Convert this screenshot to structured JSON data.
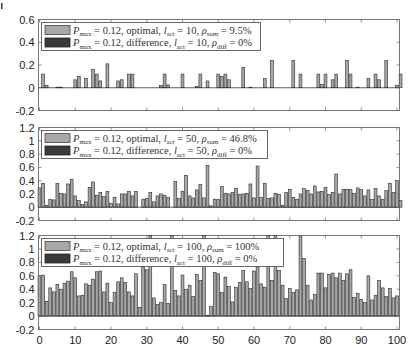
{
  "chart_data": [
    {
      "type": "bar",
      "title": "",
      "xlabel": "",
      "ylabel": "",
      "xlim": [
        0,
        100
      ],
      "ylim": [
        -0.2,
        0.6
      ],
      "yticks": [
        -0.2,
        0,
        0.2,
        0.4,
        0.6
      ],
      "xticks": [
        0,
        10,
        20,
        30,
        40,
        50,
        60,
        70,
        80,
        90,
        100
      ],
      "grid": false,
      "legend_position": "upper left",
      "series": [
        {
          "name": "P_max = 0.12, optimal, l_act = 10, ρ_sum = 9.5%",
          "color": "#a8a8a8",
          "values": [
            0,
            0.12,
            0.02,
            0,
            0,
            0.005,
            0.005,
            0,
            0,
            0,
            0.07,
            0.1,
            0,
            0.08,
            0,
            0.16,
            0.12,
            0.06,
            0,
            0.21,
            0,
            0,
            0.06,
            0.07,
            0,
            0.12,
            0.12,
            0,
            0,
            0,
            0,
            0,
            0,
            0,
            0.02,
            0.12,
            0.025,
            0,
            0,
            0,
            0.12,
            0,
            0,
            0,
            0.01,
            0.12,
            0,
            0.06,
            0,
            0,
            0.12,
            0.1,
            0.12,
            0.07,
            0,
            0,
            0,
            0.18,
            0,
            0.005,
            0,
            0,
            0,
            0.08,
            0,
            0.24,
            0,
            0,
            0,
            0,
            0,
            0.24,
            0,
            0.12,
            0,
            0,
            0,
            0,
            0.12,
            0.03,
            0.12,
            0,
            0.07,
            0.12,
            0,
            0,
            0.24,
            0.12,
            0,
            0.005,
            0,
            0,
            0.08,
            0,
            0.12,
            0.07,
            0,
            0.24,
            0,
            0,
            0.02,
            0.12,
            0
          ]
        },
        {
          "name": "P_max = 0.12, difference, l_act = 10, ρ_diff = 0%",
          "color": "#3a3a3a",
          "values": "all 0"
        }
      ]
    },
    {
      "type": "bar",
      "xlim": [
        0,
        100
      ],
      "ylim": [
        -0.2,
        1.2
      ],
      "yticks": [
        -0.2,
        0,
        0.2,
        0.4,
        0.6,
        0.8,
        1,
        1.2
      ],
      "xticks": [
        0,
        10,
        20,
        30,
        40,
        50,
        60,
        70,
        80,
        90,
        100
      ],
      "grid": false,
      "legend_position": "upper left",
      "series": [
        {
          "name": "P_max = 0.12, optimal, l_act = 50, ρ_sum = 46.8%",
          "color": "#a8a8a8",
          "values": [
            0.29,
            0.36,
            0.03,
            0.12,
            0.11,
            0.36,
            0.21,
            0.2,
            0.35,
            0.42,
            0.17,
            0.1,
            0.04,
            0.08,
            0.3,
            0.38,
            0.18,
            0.22,
            0.16,
            0.24,
            0.06,
            0.15,
            0.05,
            0.2,
            0.2,
            0.24,
            0.17,
            0.24,
            0,
            0.12,
            0.13,
            0.22,
            0.08,
            0.17,
            0.2,
            0.18,
            0.15,
            0,
            0.39,
            0.13,
            0.24,
            0.48,
            0.17,
            0.14,
            0.26,
            0.34,
            0.14,
            0.63,
            0.02,
            0.12,
            0.12,
            0.31,
            0.21,
            0.2,
            0.22,
            0.28,
            0.19,
            0.2,
            0.21,
            0.35,
            0.14,
            0.62,
            0.15,
            0.36,
            0.13,
            0.14,
            0.21,
            0.19,
            0.03,
            0.22,
            0.27,
            0.15,
            0.12,
            0.2,
            0.28,
            0.25,
            0.2,
            0.32,
            0.23,
            0.24,
            0.3,
            0.19,
            0.22,
            0.5,
            0.2,
            0.27,
            0.27,
            0.27,
            0.21,
            0.29,
            0.27,
            0.17,
            0.26,
            0.12,
            0.28,
            0.17,
            0.12,
            0.25,
            0.36,
            0.22,
            0.4,
            0.1
          ]
        },
        {
          "name": "P_max = 0.12, difference, l_act = 50, ρ_diff = 0%",
          "color": "#3a3a3a",
          "values": "all 0"
        }
      ]
    },
    {
      "type": "bar",
      "xlim": [
        0,
        100
      ],
      "ylim": [
        -0.2,
        1.2
      ],
      "yticks": [
        -0.2,
        0,
        0.2,
        0.4,
        0.6,
        0.8,
        1,
        1.2
      ],
      "xticks": [
        0,
        10,
        20,
        30,
        40,
        50,
        60,
        70,
        80,
        90,
        100
      ],
      "grid": false,
      "legend_position": "upper left",
      "series": [
        {
          "name": "P_max = 0.12, optimal, l_act = 100, ρ_sum = 100%",
          "color": "#a8a8a8",
          "values": [
            0.6,
            0.61,
            0.22,
            0.42,
            0.36,
            0.47,
            0.4,
            0.49,
            0.52,
            0.66,
            0.57,
            0.3,
            0.31,
            0.48,
            0.46,
            0.55,
            0.66,
            0.67,
            0.36,
            0.49,
            0.2,
            0.35,
            0.51,
            0.57,
            0.5,
            0.36,
            0.3,
            0.63,
            0.13,
            0.73,
            0.69,
            1.2,
            0.27,
            0.17,
            0.2,
            0.47,
            0.19,
            1.2,
            0.38,
            0.3,
            0.61,
            0.4,
            0.46,
            0.29,
            0.62,
            0.53,
            1.2,
            0.01,
            0.14,
            0.65,
            0.63,
            0.35,
            0.58,
            0.44,
            0.21,
            0.43,
            0.5,
            0.68,
            0.51,
            0.41,
            0.67,
            0.73,
            0.48,
            0.43,
            1.2,
            0.53,
            1.2,
            0.68,
            0.46,
            0.26,
            0.41,
            0.35,
            0.39,
            1.19,
            0.86,
            0.46,
            0.24,
            0.32,
            0.64,
            0.64,
            0.42,
            0.62,
            0.64,
            0.57,
            0.64,
            0.53,
            0.63,
            0.69,
            0.28,
            0.34,
            0.25,
            0.2,
            0.6,
            0.24,
            0.31,
            0.53,
            0.42,
            0.29,
            0.41,
            0.27,
            0.3
          ]
        },
        {
          "name": "P_max = 0.12, difference, l_act = 100, ρ_diff = 0%",
          "color": "#3a3a3a",
          "values": "all 0"
        }
      ]
    }
  ],
  "panels": [
    {
      "yticks": [
        "0.6",
        "0.4",
        "0.2",
        "0",
        "-0.2"
      ],
      "legend": {
        "line1": {
          "P": "P",
          "sub1": "max",
          "eq1": " = 0.12, optimal, ",
          "l": "l",
          "sub2": "act",
          "eq2": " = 10, ",
          "rho": "ρ",
          "sub3": "sum",
          "eq3": " = 9.5%"
        },
        "line2": {
          "P": "P",
          "sub1": "max",
          "eq1": " = 0.12, difference, ",
          "l": "l",
          "sub2": "act",
          "eq2": " = 10, ",
          "rho": "ρ",
          "sub3": "diff",
          "eq3": " = 0%"
        }
      }
    },
    {
      "yticks": [
        "1.2",
        "1",
        "0.8",
        "0.6",
        "0.4",
        "0.2",
        "0",
        "-0.2"
      ],
      "legend": {
        "line1": {
          "P": "P",
          "sub1": "max",
          "eq1": " = 0.12, optimal, ",
          "l": "l",
          "sub2": "act",
          "eq2": " = 50, ",
          "rho": "ρ",
          "sub3": "sum",
          "eq3": " = 46.8%"
        },
        "line2": {
          "P": "P",
          "sub1": "max",
          "eq1": " = 0.12, difference, ",
          "l": "l",
          "sub2": "act",
          "eq2": " = 50, ",
          "rho": "ρ",
          "sub3": "diff",
          "eq3": " = 0%"
        }
      }
    },
    {
      "yticks": [
        "1.2",
        "1",
        "0.8",
        "0.6",
        "0.4",
        "0.2",
        "0",
        "-0.2"
      ],
      "legend": {
        "line1": {
          "P": "P",
          "sub1": "max",
          "eq1": " = 0.12, optimal, ",
          "l": "l",
          "sub2": "act",
          "eq2": " = 100, ",
          "rho": "ρ",
          "sub3": "sum",
          "eq3": " = 100%"
        },
        "line2": {
          "P": "P",
          "sub1": "max",
          "eq1": " = 0.12, difference, ",
          "l": "l",
          "sub2": "act",
          "eq2": " = 100, ",
          "rho": "ρ",
          "sub3": "diff",
          "eq3": " = 0%"
        }
      }
    }
  ],
  "xticks": [
    "0",
    "10",
    "20",
    "30",
    "40",
    "50",
    "60",
    "70",
    "80",
    "90",
    "100"
  ],
  "colors": {
    "optimal": "#a8a8a8",
    "difference": "#3a3a3a",
    "axis": "#555555",
    "bar_edge": "#2a2a2a"
  }
}
